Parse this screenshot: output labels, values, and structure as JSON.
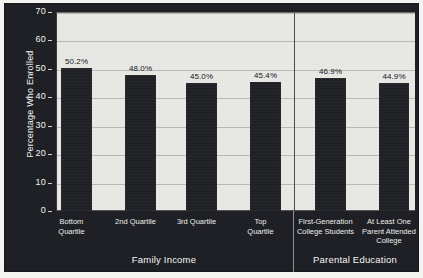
{
  "chart_data": {
    "type": "bar",
    "title": "",
    "subtitle": "",
    "xlabel": "",
    "ylabel": "Percentage Who Enrolled",
    "ylim": [
      0,
      70
    ],
    "ytick_step": 10,
    "yticks": [
      "70",
      "60",
      "50",
      "40",
      "30",
      "20",
      "10",
      "0"
    ],
    "grid": true,
    "legend": "none",
    "categories": [
      "Bottom Quartile",
      "2nd Quartile",
      "3rd Quartile",
      "Top Quartile",
      "First-Generation College Students",
      "At Least One Parent Attended College"
    ],
    "values": [
      50.2,
      48.0,
      45.0,
      45.4,
      46.9,
      44.9
    ],
    "data_labels": [
      "50.2%",
      "48.0%",
      "45.0%",
      "45.4%",
      "46.9%",
      "44.9%"
    ],
    "groups": [
      {
        "title": "Family Income",
        "categories": [
          0,
          1,
          2,
          3
        ]
      },
      {
        "title": "Parental Education",
        "categories": [
          4,
          5
        ]
      }
    ],
    "colors": {
      "bar": "#202227",
      "plot_background": "#e9e9e6",
      "panel_background": "#1d1f24",
      "gridline": "#b9b9b4",
      "axis_text": "#f2f2f0",
      "data_label_text": "#16171b"
    }
  },
  "category_label_lines": [
    [
      "Bottom",
      "Quartile"
    ],
    [
      "2nd Quartile"
    ],
    [
      "3rd Quartile"
    ],
    [
      "Top",
      "Quartile"
    ],
    [
      "First-Generation",
      "College Students"
    ],
    [
      "At Least One",
      "Parent Attended",
      "College"
    ]
  ],
  "group_titles": [
    "Family Income",
    "Parental Education"
  ]
}
